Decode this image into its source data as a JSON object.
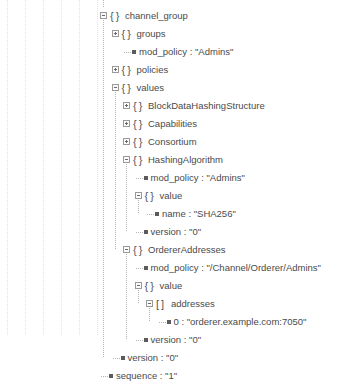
{
  "viewer": {
    "kind": "json-tree-viewer",
    "object_glyph": "{ }",
    "array_glyph": "[ ]",
    "expanded_symbol": "-",
    "collapsed_symbol": "+",
    "text_color": "#4a4a4a",
    "line_color": "#b4b4b4",
    "background": "#ffffff"
  },
  "tree": {
    "nodes": [
      {
        "key": "channel_group",
        "type": "object",
        "depth": 0,
        "state": "expanded",
        "display": "channel_group"
      },
      {
        "key": "groups",
        "type": "object",
        "depth": 1,
        "state": "collapsed",
        "display": "groups"
      },
      {
        "key": "mod_policy",
        "type": "leaf",
        "depth": 2,
        "value": "\"Admins\"",
        "display": "mod_policy : \"Admins\""
      },
      {
        "key": "policies",
        "type": "object",
        "depth": 1,
        "state": "collapsed",
        "display": "policies"
      },
      {
        "key": "values",
        "type": "object",
        "depth": 1,
        "state": "expanded",
        "display": "values"
      },
      {
        "key": "BlockDataHashingStructure",
        "type": "object",
        "depth": 2,
        "state": "collapsed",
        "display": "BlockDataHashingStructure"
      },
      {
        "key": "Capabilities",
        "type": "object",
        "depth": 2,
        "state": "collapsed",
        "display": "Capabilities"
      },
      {
        "key": "Consortium",
        "type": "object",
        "depth": 2,
        "state": "collapsed",
        "display": "Consortium"
      },
      {
        "key": "HashingAlgorithm",
        "type": "object",
        "depth": 2,
        "state": "expanded",
        "display": "HashingAlgorithm"
      },
      {
        "key": "mod_policy",
        "type": "leaf",
        "depth": 3,
        "value": "\"Admins\"",
        "display": "mod_policy : \"Admins\""
      },
      {
        "key": "value",
        "type": "object",
        "depth": 3,
        "state": "expanded",
        "display": "value"
      },
      {
        "key": "name",
        "type": "leaf",
        "depth": 4,
        "value": "\"SHA256\"",
        "display": "name : \"SHA256\""
      },
      {
        "key": "version",
        "type": "leaf",
        "depth": 3,
        "value": "\"0\"",
        "display": "version : \"0\""
      },
      {
        "key": "OrdererAddresses",
        "type": "object",
        "depth": 2,
        "state": "expanded",
        "display": "OrdererAddresses"
      },
      {
        "key": "mod_policy",
        "type": "leaf",
        "depth": 3,
        "value": "\"/Channel/Orderer/Admins\"",
        "display": "mod_policy : \"/Channel/Orderer/Admins\""
      },
      {
        "key": "value",
        "type": "object",
        "depth": 3,
        "state": "expanded",
        "display": "value"
      },
      {
        "key": "addresses",
        "type": "array",
        "depth": 4,
        "state": "expanded",
        "display": "addresses"
      },
      {
        "key": "0",
        "type": "leaf",
        "depth": 5,
        "value": "\"orderer.example.com:7050\"",
        "display": "0 : \"orderer.example.com:7050\""
      },
      {
        "key": "version",
        "type": "leaf",
        "depth": 3,
        "value": "\"0\"",
        "display": "version : \"0\""
      },
      {
        "key": "version",
        "type": "leaf",
        "depth": 1,
        "value": "\"0\"",
        "display": "version : \"0\""
      },
      {
        "key": "sequence",
        "type": "leaf",
        "depth": 0,
        "value": "\"1\"",
        "display": "sequence : \"1\""
      }
    ]
  },
  "guides": {
    "x_positions": [
      7,
      25,
      43,
      61,
      79,
      97
    ]
  }
}
